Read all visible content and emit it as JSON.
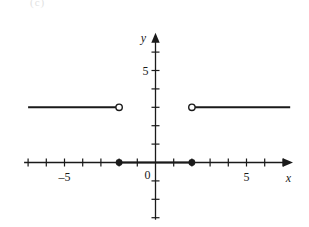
{
  "figure": {
    "corner_mark": "(c)",
    "background_color": "#ffffff",
    "ink_color": "#1a1a1a"
  },
  "axes": {
    "x_axis_label": "x",
    "y_axis_label": "y",
    "origin_label": "0",
    "x_tick_labels": [
      {
        "value": -5,
        "text": "–5"
      },
      {
        "value": 5,
        "text": "5"
      }
    ],
    "y_tick_labels": [
      {
        "value": 5,
        "text": "5"
      }
    ],
    "x_range": [
      -7,
      7.5
    ],
    "y_range": [
      -3,
      7
    ],
    "x_ticks": [
      -7,
      -6,
      -5,
      -4,
      -3,
      -2,
      -1,
      1,
      2,
      3,
      4,
      5,
      6,
      7
    ],
    "y_ticks": [
      -3,
      -2,
      -1,
      1,
      2,
      3,
      4,
      5,
      6
    ],
    "grid": false,
    "x_arrow": true,
    "y_arrow": true
  },
  "chart_data": {
    "type": "line",
    "title": "",
    "xlabel": "x",
    "ylabel": "y",
    "xlim": [
      -7,
      7.5
    ],
    "ylim": [
      -3,
      7
    ],
    "grid": false,
    "legend": "none",
    "series": [
      {
        "name": "left-ray",
        "y": 3,
        "x_start": -7,
        "x_end": -2,
        "start_marker": "none",
        "end_marker": "open"
      },
      {
        "name": "middle-segment",
        "y": 0,
        "x_start": -2,
        "x_end": 2,
        "start_marker": "closed",
        "end_marker": "closed"
      },
      {
        "name": "right-ray",
        "y": 3,
        "x_start": 2,
        "x_end": 7.4,
        "start_marker": "open",
        "end_marker": "none"
      }
    ],
    "points": [
      {
        "x": -2,
        "y": 3,
        "marker": "open"
      },
      {
        "x": -2,
        "y": 0,
        "marker": "closed"
      },
      {
        "x": 2,
        "y": 0,
        "marker": "closed"
      },
      {
        "x": 2,
        "y": 3,
        "marker": "open"
      }
    ]
  }
}
